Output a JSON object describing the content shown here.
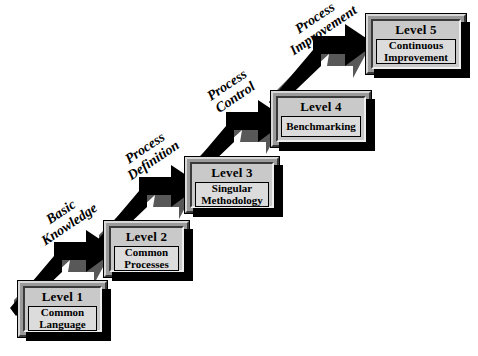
{
  "diagram": {
    "type": "staircase",
    "background_color": "#ffffff",
    "box_face_color": "#c9c9c9",
    "box_frame_color": "#9a9a9a",
    "box_panel_color": "#dcdcdc",
    "arrow_color": "#000000",
    "levels": [
      {
        "title": "Level 1",
        "lines": [
          "Common",
          "Language"
        ],
        "step": 1
      },
      {
        "title": "Level 2",
        "lines": [
          "Common",
          "Processes"
        ],
        "step": 2
      },
      {
        "title": "Level 3",
        "lines": [
          "Singular",
          "Methodology"
        ],
        "step": 3
      },
      {
        "title": "Level 4",
        "lines": [
          "Benchmarking"
        ],
        "step": 4
      },
      {
        "title": "Level 5",
        "lines": [
          "Continuous",
          "Improvement"
        ],
        "step": 5
      }
    ],
    "transitions": [
      {
        "lines": [
          "Basic",
          "Knowledge"
        ],
        "from": "Level 1",
        "to": "Level 2"
      },
      {
        "lines": [
          "Process",
          "Definition"
        ],
        "from": "Level 2",
        "to": "Level 3"
      },
      {
        "lines": [
          "Process",
          "Control"
        ],
        "from": "Level 3",
        "to": "Level 4"
      },
      {
        "lines": [
          "Process",
          "Improvement"
        ],
        "from": "Level 4",
        "to": "Level 5"
      }
    ]
  }
}
